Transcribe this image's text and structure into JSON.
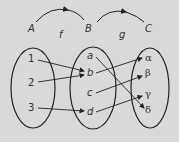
{
  "diagram": {
    "type": "function-composition",
    "sets": [
      {
        "name": "A",
        "elements": [
          "1",
          "2",
          "3"
        ]
      },
      {
        "name": "B",
        "elements": [
          "a",
          "b",
          "c",
          "d"
        ]
      },
      {
        "name": "C",
        "elements": [
          "α",
          "β",
          "γ",
          "δ"
        ]
      }
    ],
    "functions": [
      {
        "name": "f",
        "from": "A",
        "to": "B",
        "mapping": [
          [
            "1",
            "b"
          ],
          [
            "2",
            "b"
          ],
          [
            "3",
            "d"
          ]
        ]
      },
      {
        "name": "g",
        "from": "B",
        "to": "C",
        "mapping": [
          [
            "a",
            "δ"
          ],
          [
            "b",
            "α"
          ],
          [
            "c",
            "β"
          ],
          [
            "d",
            "γ"
          ]
        ]
      }
    ],
    "colors": {
      "background": "#d9d9d9",
      "stroke": "#222222"
    }
  },
  "labels": {
    "A": "A",
    "B": "B",
    "C": "C",
    "f": "f",
    "g": "g",
    "e1": "1",
    "e2": "2",
    "e3": "3",
    "ea": "a",
    "eb": "b",
    "ec": "c",
    "ed": "d",
    "alpha": "α",
    "beta": "β",
    "gamma": "γ",
    "delta": "δ"
  }
}
